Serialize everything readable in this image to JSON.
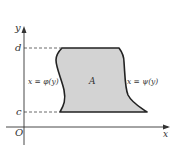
{
  "diagram": {
    "axes": {
      "x_label": "x",
      "y_label": "y",
      "origin_label": "O"
    },
    "levels": {
      "top_label": "d",
      "bottom_label": "c"
    },
    "region": {
      "label": "A",
      "fill_color": "#d3d3d3",
      "stroke_color": "#222222"
    },
    "curves": {
      "left_label": "x = φ(y)",
      "right_label": "x = ψ(y)"
    }
  }
}
